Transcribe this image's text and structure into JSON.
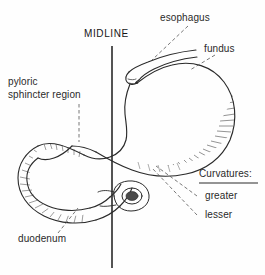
{
  "figure": {
    "background_color": "#fefefe",
    "ink_color": "#222222",
    "width": 265,
    "height": 275
  },
  "labels": {
    "midline": "MIDLINE",
    "esophagus": "esophagus",
    "fundus": "fundus",
    "pyloric_line1": "pyloric",
    "pyloric_line2": "sphincter region",
    "duodenum": "duodenum",
    "curvatures_heading": "Curvatures:",
    "curvature_greater": "greater",
    "curvature_lesser": "lesser"
  },
  "structures": [
    {
      "name": "esophagus",
      "description": "tube entering stomach at upper left of organ"
    },
    {
      "name": "fundus",
      "description": "domed upper region of stomach"
    },
    {
      "name": "body",
      "description": "main stomach sac"
    },
    {
      "name": "greater-curvature",
      "description": "long convex outer border, hatched"
    },
    {
      "name": "lesser-curvature",
      "description": "short concave inner border"
    },
    {
      "name": "pyloric-sphincter-region",
      "description": "narrowed outlet at left"
    },
    {
      "name": "duodenum",
      "description": "C-shaped loop continuing from pylorus"
    },
    {
      "name": "duodenal-cross-section",
      "description": "small oval ring near midline"
    },
    {
      "name": "midline-axis",
      "description": "vertical reference line"
    }
  ]
}
